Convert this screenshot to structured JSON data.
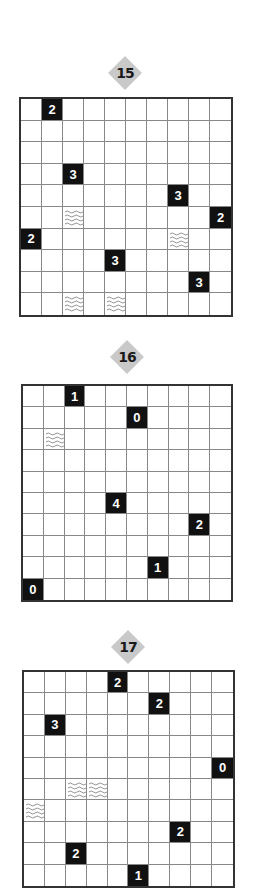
{
  "puzzles": [
    {
      "number": "15",
      "badge": {
        "x": 108,
        "y": 56
      },
      "grid": {
        "x": 19,
        "y": 97,
        "w": 214,
        "h": 220
      },
      "rows": 10,
      "cols": 10,
      "clues": [
        {
          "r": 0,
          "c": 1,
          "v": "2"
        },
        {
          "r": 3,
          "c": 2,
          "v": "3"
        },
        {
          "r": 4,
          "c": 7,
          "v": "3"
        },
        {
          "r": 5,
          "c": 9,
          "v": "2"
        },
        {
          "r": 6,
          "c": 0,
          "v": "2"
        },
        {
          "r": 7,
          "c": 4,
          "v": "3"
        },
        {
          "r": 8,
          "c": 8,
          "v": "3"
        }
      ],
      "water": [
        {
          "r": 5,
          "c": 2
        },
        {
          "r": 6,
          "c": 7
        },
        {
          "r": 9,
          "c": 2
        },
        {
          "r": 9,
          "c": 4
        }
      ]
    },
    {
      "number": "16",
      "badge": {
        "x": 110,
        "y": 340
      },
      "grid": {
        "x": 21,
        "y": 384,
        "w": 212,
        "h": 218
      },
      "rows": 10,
      "cols": 10,
      "clues": [
        {
          "r": 0,
          "c": 2,
          "v": "1"
        },
        {
          "r": 1,
          "c": 5,
          "v": "0"
        },
        {
          "r": 5,
          "c": 4,
          "v": "4"
        },
        {
          "r": 6,
          "c": 8,
          "v": "2"
        },
        {
          "r": 8,
          "c": 6,
          "v": "1"
        },
        {
          "r": 9,
          "c": 0,
          "v": "0"
        }
      ],
      "water": [
        {
          "r": 2,
          "c": 1
        }
      ]
    },
    {
      "number": "17",
      "badge": {
        "x": 111,
        "y": 630
      },
      "grid": {
        "x": 22,
        "y": 670,
        "w": 213,
        "h": 218
      },
      "rows": 10,
      "cols": 10,
      "clues": [
        {
          "r": 0,
          "c": 4,
          "v": "2"
        },
        {
          "r": 1,
          "c": 6,
          "v": "2"
        },
        {
          "r": 2,
          "c": 1,
          "v": "3"
        },
        {
          "r": 4,
          "c": 9,
          "v": "0"
        },
        {
          "r": 7,
          "c": 7,
          "v": "2"
        },
        {
          "r": 8,
          "c": 2,
          "v": "2"
        },
        {
          "r": 9,
          "c": 5,
          "v": "1"
        }
      ],
      "water": [
        {
          "r": 5,
          "c": 2
        },
        {
          "r": 5,
          "c": 3
        },
        {
          "r": 6,
          "c": 0
        }
      ]
    }
  ],
  "icons": {
    "water": "water-waves-icon",
    "badge": "diamond-badge-icon"
  },
  "colors": {
    "badge": "#c9c9c9",
    "clue_bg": "#111111",
    "clue_text": "#ffffff",
    "grid_line": "#888888",
    "border": "#333333"
  }
}
